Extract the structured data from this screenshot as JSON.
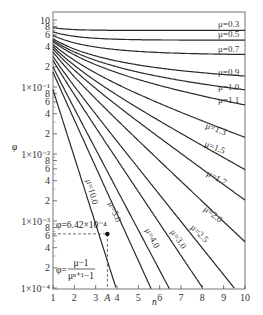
{
  "chart_data": {
    "type": "line",
    "title": "",
    "xlabel": "n",
    "ylabel": "φ",
    "xscale": "linear",
    "yscale": "log",
    "xlim": [
      1,
      10
    ],
    "ylim": [
      0.0001,
      1
    ],
    "grid": false,
    "legend": "inline labels at line ends",
    "x_ticks": [
      "1",
      "2",
      "3",
      "A",
      "4",
      "5",
      "6",
      "7",
      "8",
      "9",
      "10"
    ],
    "y_tick_labels": [
      {
        "label": "10",
        "value": 1
      },
      {
        "label": "8",
        "value": 0.8
      },
      {
        "label": "6",
        "value": 0.6
      },
      {
        "label": "4",
        "value": 0.4
      },
      {
        "label": "2",
        "value": 0.2
      },
      {
        "label": "1×10⁻¹",
        "value": 0.1
      },
      {
        "label": "8",
        "value": 0.08
      },
      {
        "label": "6",
        "value": 0.06
      },
      {
        "label": "4",
        "value": 0.04
      },
      {
        "label": "2",
        "value": 0.02
      },
      {
        "label": "1×10⁻²",
        "value": 0.01
      },
      {
        "label": "8",
        "value": 0.008
      },
      {
        "label": "6",
        "value": 0.006
      },
      {
        "label": "4",
        "value": 0.004
      },
      {
        "label": "2",
        "value": 0.002
      },
      {
        "label": "1×10⁻³",
        "value": 0.001
      },
      {
        "label": "8",
        "value": 0.0008
      },
      {
        "label": "6",
        "value": 0.0006
      },
      {
        "label": "4",
        "value": 0.0004
      },
      {
        "label": "2",
        "value": 0.0002
      },
      {
        "label": "1×10⁻⁴",
        "value": 0.0001
      }
    ],
    "formula": "φ = (μ−1)/(μ^(n+1)−1)",
    "series": [
      {
        "name": "μ=0.3",
        "mu": 0.3
      },
      {
        "name": "μ=0.5",
        "mu": 0.5
      },
      {
        "name": "μ=0.7",
        "mu": 0.7
      },
      {
        "name": "μ=0.9",
        "mu": 0.9
      },
      {
        "name": "μ=1.0",
        "mu": 1.0
      },
      {
        "name": "μ=1.1",
        "mu": 1.1
      },
      {
        "name": "μ=1.3",
        "mu": 1.3
      },
      {
        "name": "μ=1.5",
        "mu": 1.5
      },
      {
        "name": "μ=1.7",
        "mu": 1.7
      },
      {
        "name": "μ=2.0",
        "mu": 2.0
      },
      {
        "name": "μ=2.5",
        "mu": 2.5
      },
      {
        "name": "μ=3.0",
        "mu": 3.0
      },
      {
        "name": "μ=4.0",
        "mu": 4.0
      },
      {
        "name": "μ=5.0",
        "mu": 5.0
      },
      {
        "name": "μ=10.0",
        "mu": 10.0
      }
    ],
    "annotations": {
      "point_label": "φ=6.42×10⁻⁴",
      "point": {
        "n": 3.55,
        "phi": 0.000642
      },
      "formula_numerator": "μ−1",
      "formula_denominator": "μⁿ⁺¹−1",
      "formula_lhs": "φ=",
      "marker_x_label": "A"
    }
  }
}
